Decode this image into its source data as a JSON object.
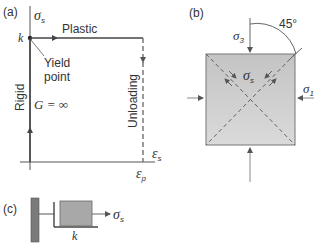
{
  "panel_a": {
    "label": "(a)",
    "y_axis": "σ",
    "y_axis_sub": "s",
    "x_axis": "ε",
    "x_axis_sub": "s",
    "yield_value": "k",
    "plastic_label": "Plastic",
    "yield_label_line1": "Yield",
    "yield_label_line2": "point",
    "rigid_label": "Rigid",
    "modulus_label": "G = ∞",
    "unloading_label": "Unloading",
    "x_tick": "ε",
    "x_tick_sub": "p"
  },
  "panel_b": {
    "label": "(b)",
    "angle_label": "45°",
    "sigma3": "σ",
    "sigma3_sub": "3",
    "sigma1": "σ",
    "sigma1_sub": "1",
    "shear": "σ",
    "shear_sub": "s",
    "block_color": "#c9c9c9"
  },
  "panel_c": {
    "label": "(c)",
    "force": "σ",
    "force_sub": "s",
    "friction": "k",
    "wall_color": "#7a7a7a",
    "block_color": "#a8a8a8"
  }
}
